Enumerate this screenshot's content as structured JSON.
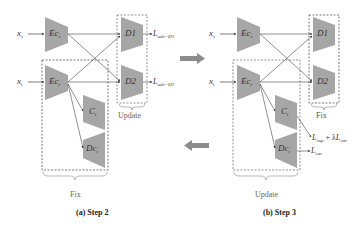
{
  "panels": [
    {
      "caption": "(a) Step 2",
      "inputs": {
        "source": "x",
        "source_sub": "s",
        "target": "x",
        "target_sub": "t"
      },
      "modules": {
        "enc_source": {
          "name": "Ec",
          "sub": "s"
        },
        "enc_target": {
          "name": "Ec",
          "sub": "t"
        },
        "classifier": {
          "name": "C",
          "sub": "t"
        },
        "decoder": {
          "name": "Dc",
          "sub": "t"
        },
        "disc1": {
          "name": "D1"
        },
        "disc2": {
          "name": "D2"
        }
      },
      "losses": {
        "d1": {
          "name": "L",
          "sub": "adv−D1"
        },
        "d2": {
          "name": "L",
          "sub": "adv−D2"
        }
      },
      "groups": {
        "discriminators": "Update",
        "target_branch": "Fix"
      }
    },
    {
      "caption": "(b) Step 3",
      "inputs": {
        "source": "x",
        "source_sub": "s",
        "target": "x",
        "target_sub": "t"
      },
      "modules": {
        "enc_source": {
          "name": "Ec",
          "sub": "s"
        },
        "enc_target": {
          "name": "Ec",
          "sub": "t"
        },
        "classifier": {
          "name": "C",
          "sub": "t"
        },
        "decoder": {
          "name": "Dc",
          "sub": "t"
        },
        "disc1": {
          "name": "D1"
        },
        "disc2": {
          "name": "D2"
        }
      },
      "losses": {
        "classifier": {
          "a": "L",
          "a_sub": "sup",
          "plus": " + λ",
          "b": "L",
          "b_sub": "var"
        },
        "decoder": {
          "name": "L",
          "sub": "var"
        }
      },
      "groups": {
        "discriminators": "Fix",
        "target_branch": "Update"
      }
    }
  ],
  "arrows": {
    "right": "step-forward-arrow",
    "left": "step-back-arrow"
  },
  "colors": {
    "module_fill": "#a6a6a6",
    "line": "#555555",
    "dash": "#555555",
    "big_arrow": "#8c8c8c"
  }
}
